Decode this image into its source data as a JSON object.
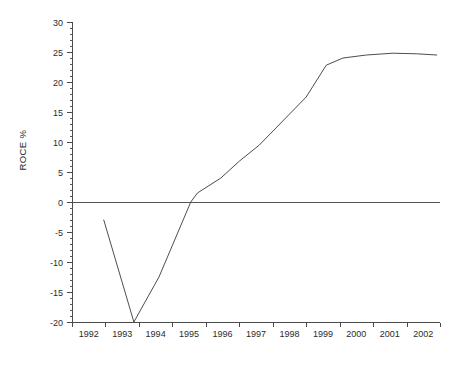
{
  "chart_data": {
    "type": "line",
    "title": "",
    "subtitle": "",
    "xlabel": "",
    "ylabel": "ROCE %",
    "xlim": [
      1992,
      2003
    ],
    "ylim": [
      -20,
      30
    ],
    "grid": false,
    "legend": null,
    "y_ticks": [
      -20,
      -15,
      -10,
      -5,
      0,
      5,
      10,
      15,
      20,
      25,
      30
    ],
    "y_tick_labels": [
      "-20",
      "-15",
      "-10",
      "-5",
      "0",
      "5",
      "10",
      "15",
      "20",
      "25",
      "30"
    ],
    "y_minor_tick_step": 1,
    "x_ticks": [
      1992,
      1993,
      1994,
      1995,
      1996,
      1997,
      1998,
      1999,
      2000,
      2001,
      2002,
      2003
    ],
    "x_tick_labels": [
      "1992",
      "1993",
      "1994",
      "1995",
      "1996",
      "1997",
      "1998",
      "1999",
      "2000",
      "2001",
      "2002"
    ],
    "x_label_placement": "between-ticks",
    "zero_line": 0,
    "series": [
      {
        "name": "ROCE %",
        "color": "#4d4d4d",
        "x": [
          1992.95,
          1993.85,
          1994.6,
          1995.55,
          1995.75,
          1996.45,
          1997.0,
          1997.6,
          1998.3,
          1999.0,
          1999.6,
          2000.1,
          2000.8,
          2001.6,
          2002.3,
          2002.9
        ],
        "y": [
          -3.0,
          -20.0,
          -12.5,
          0.0,
          1.5,
          4.0,
          6.8,
          9.5,
          13.5,
          17.5,
          22.8,
          24.0,
          24.5,
          24.8,
          24.7,
          24.5
        ]
      }
    ],
    "annotations": []
  }
}
